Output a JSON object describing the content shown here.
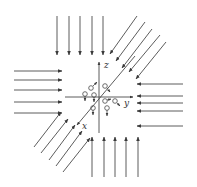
{
  "diagram": {
    "colors": {
      "line": "#4a4a4a",
      "background": "#ffffff"
    },
    "axes": {
      "z_label": "z",
      "y_label": "y",
      "x_label": "x"
    },
    "arrow_groups": [
      {
        "name": "top",
        "direction": "down",
        "count": 5
      },
      {
        "name": "top-right",
        "direction": "down-left",
        "count": 6
      },
      {
        "name": "right",
        "direction": "left",
        "count": 5
      },
      {
        "name": "left",
        "direction": "right",
        "count": 5
      },
      {
        "name": "bottom-left",
        "direction": "up-right",
        "count": 6
      },
      {
        "name": "bottom",
        "direction": "up",
        "count": 5
      }
    ],
    "particles": {
      "count": 9,
      "shape": "circle-with-arrow"
    }
  }
}
